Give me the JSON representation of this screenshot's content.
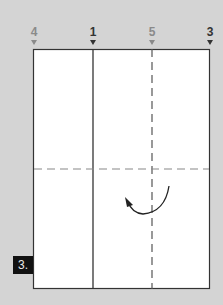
{
  "diagram": {
    "type": "origami-fold-step",
    "step_label": "3.",
    "reference_labels": [
      {
        "text": "4",
        "x": 34,
        "style": "valley",
        "color": "#8a8a8a"
      },
      {
        "text": "1",
        "x": 93,
        "style": "solid",
        "color": "#333333"
      },
      {
        "text": "5",
        "x": 152,
        "style": "valley",
        "color": "#8a8a8a"
      },
      {
        "text": "3",
        "x": 210,
        "style": "solid",
        "color": "#333333"
      }
    ],
    "paper": {
      "x": 33,
      "y": 49,
      "width": 177,
      "height": 240,
      "fill": "#ffffff",
      "stroke": "#333333"
    },
    "lines": [
      {
        "kind": "solid-vertical",
        "x": 93
      },
      {
        "kind": "dashed-vertical",
        "x": 152
      },
      {
        "kind": "dashed-horizontal",
        "y": 169
      }
    ],
    "fold_arrow": {
      "direction": "counter-clockwise",
      "center_x": 147,
      "center_y": 193
    }
  }
}
